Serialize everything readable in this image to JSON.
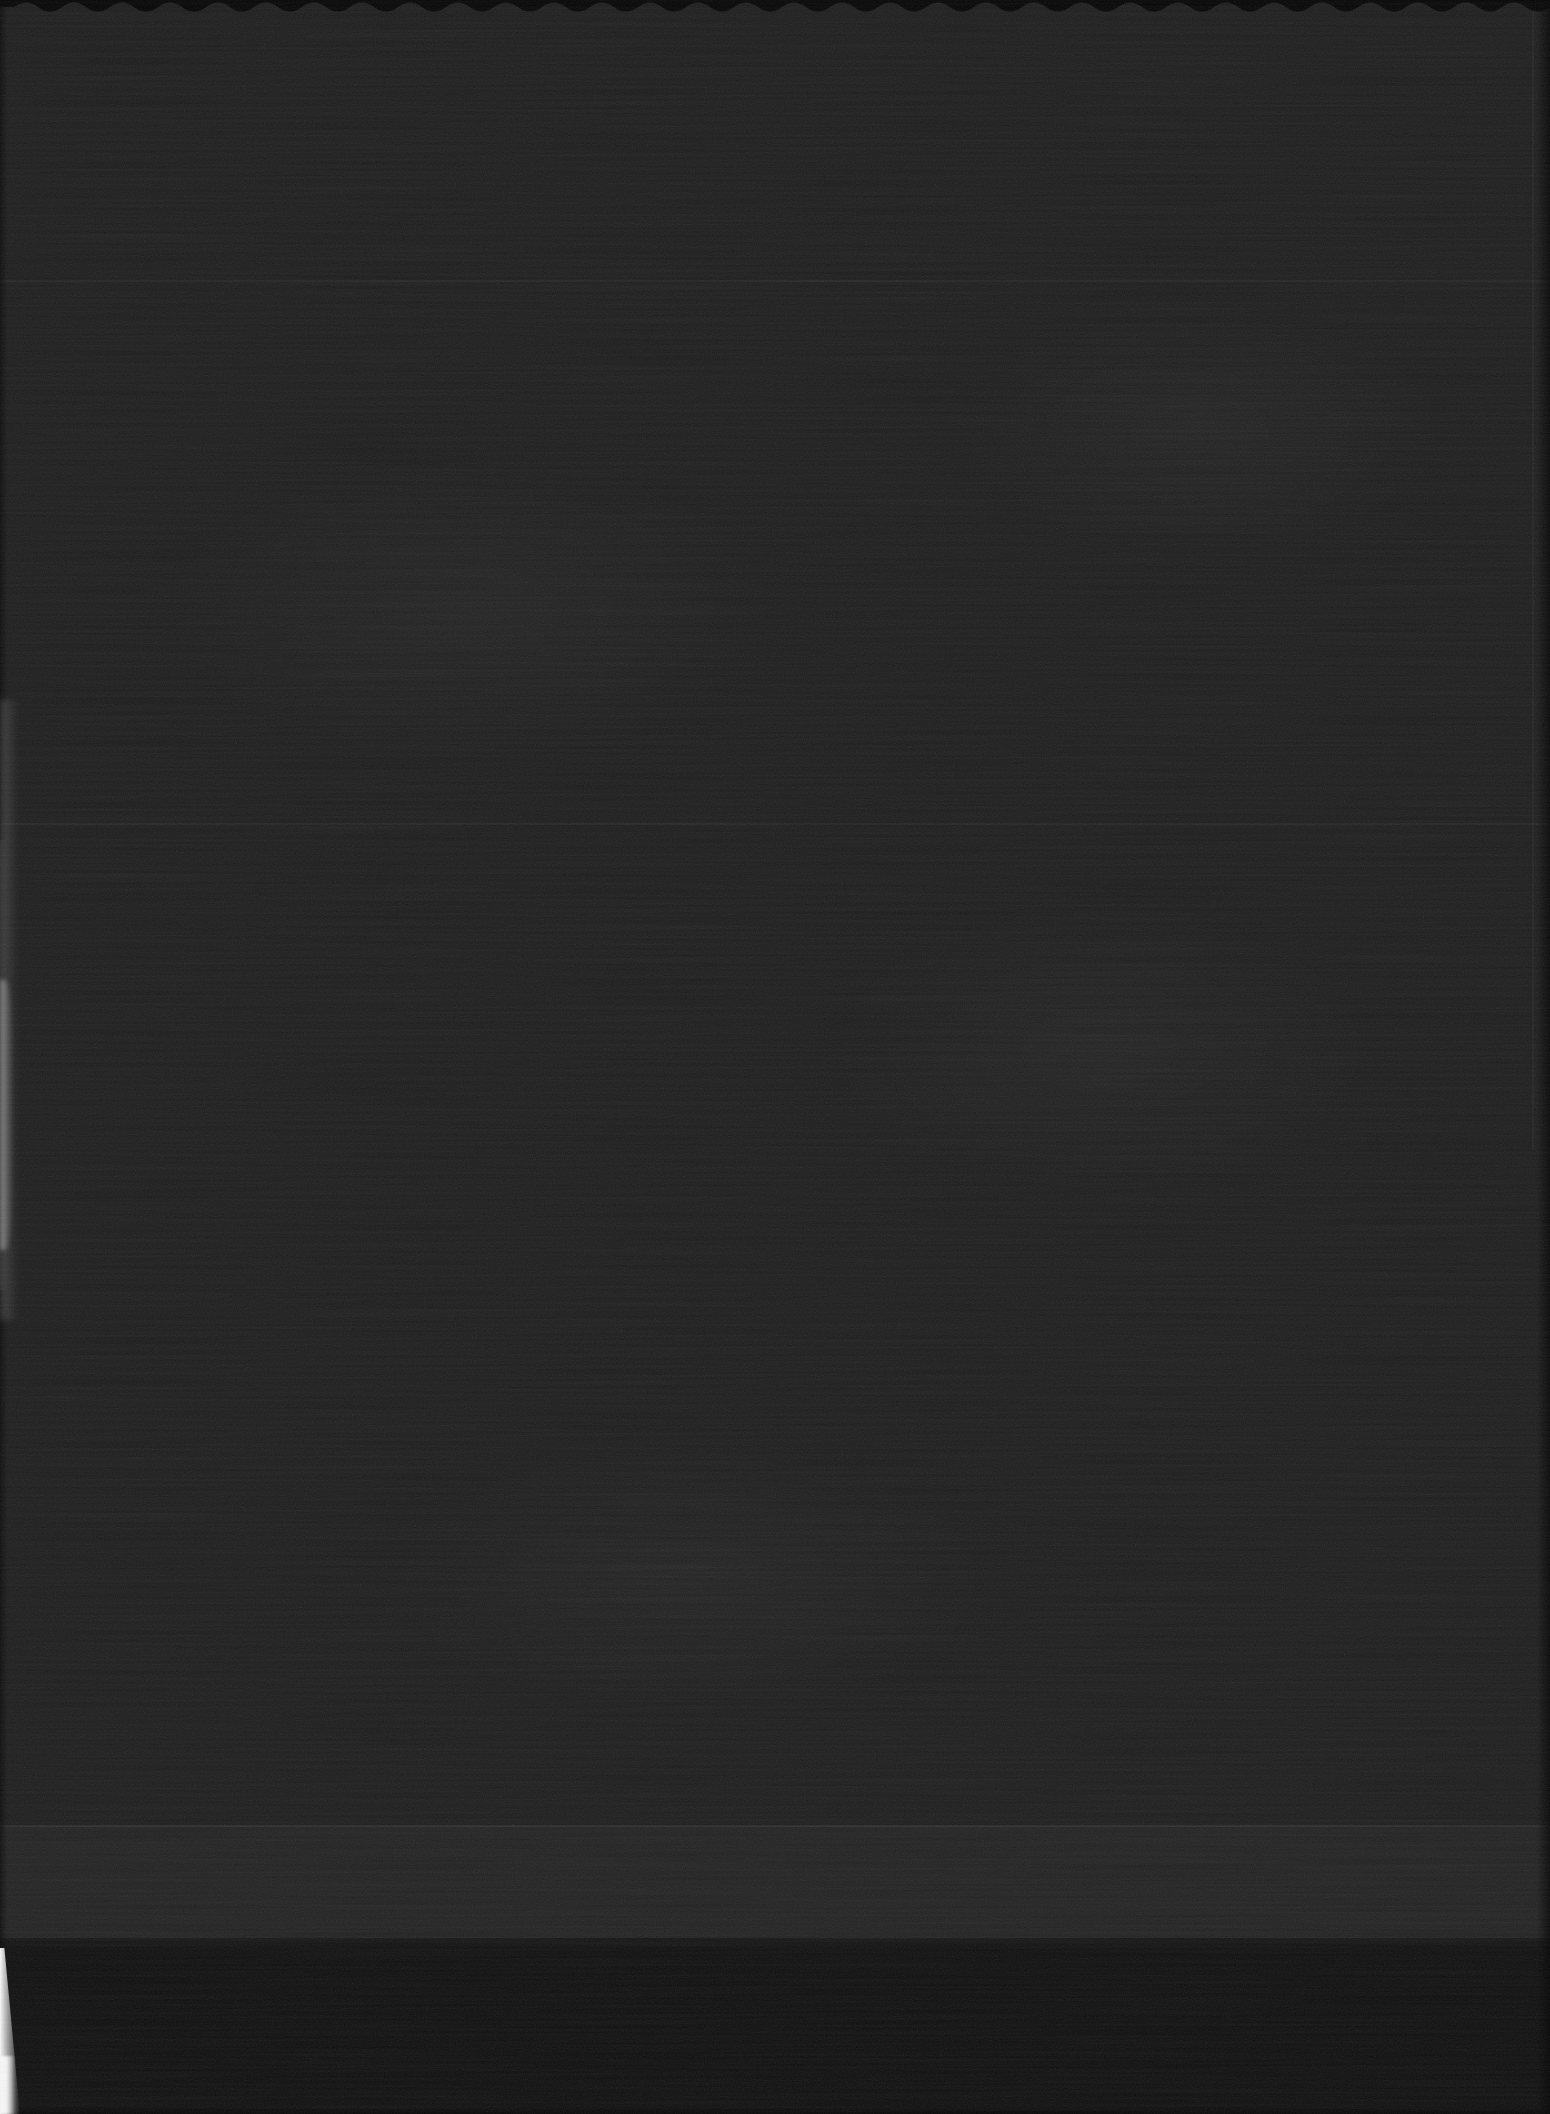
{
  "page": {
    "content": "",
    "visible_text_present": false
  },
  "colors": {
    "page_surface": "#1b1b1b",
    "deckle_edge": "#020202",
    "bottom_band": "#0d0d0d",
    "bottom_edge_shadow": "#000000",
    "left_glow": "#b0b0b0",
    "corner_highlight": "#fbfbfb",
    "scanline": "#ffffff",
    "right_edge_shadow": "#000000"
  }
}
